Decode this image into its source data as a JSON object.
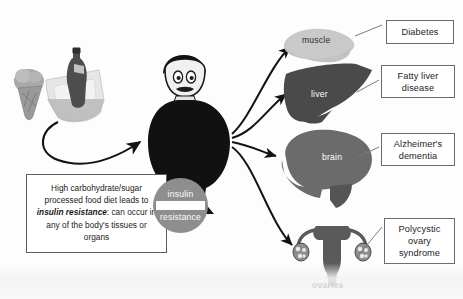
{
  "diagram": {
    "description_box": {
      "line1": "High carbohydrate/sugar",
      "line2": "processed food diet leads",
      "line3_pre": "to ",
      "line3_em": "insulin resistance",
      "line3_post": ": can",
      "line4": "occur in any of the body's",
      "line5": "tissues or organs"
    },
    "center_node": {
      "word_top": "insulin",
      "word_bottom": "resistance",
      "fill_color": "#8e8e8e",
      "text_color": "#ffffff"
    },
    "source_illustration": {
      "name": "junk-food-illustration",
      "items": [
        "ice-cream-cone",
        "soda-bottle",
        "fries-container"
      ]
    },
    "person": {
      "name": "obese-cartoon-person",
      "fill_color": "#111111"
    },
    "organs": [
      {
        "id": "muscle",
        "label": "muscle",
        "fill_color": "#c9c9c9",
        "label_style": "on-light",
        "outcome": "Diabetes"
      },
      {
        "id": "liver",
        "label": "liver",
        "fill_color": "#4a4a4a",
        "label_style": "on-dark",
        "outcome": "Fatty liver disease"
      },
      {
        "id": "brain",
        "label": "brain",
        "fill_color": "#6b6b6b",
        "label_style": "on-dark",
        "outcome": "Alzheimer's dementia"
      },
      {
        "id": "ovaries",
        "label": "ovaries",
        "fill_color": "#5a5a5a",
        "label_style": "on-light",
        "outcome": "Polycystic ovary syndrome"
      }
    ],
    "outcome_boxes": [
      {
        "id": "diabetes",
        "lines": [
          "Diabetes"
        ]
      },
      {
        "id": "fatty-liver-disease",
        "lines": [
          "Fatty liver",
          "disease"
        ]
      },
      {
        "id": "alzheimers-dementia",
        "lines": [
          "Alzheimer's",
          "dementia"
        ]
      },
      {
        "id": "polycystic-ovary-syndrome",
        "lines": [
          "Polycystic",
          "ovary",
          "syndrome"
        ]
      }
    ],
    "colors": {
      "background": "#fdfdfd",
      "arrow": "#131313",
      "box_border": "#6a6a6a",
      "text": "#1d1d1d"
    }
  }
}
